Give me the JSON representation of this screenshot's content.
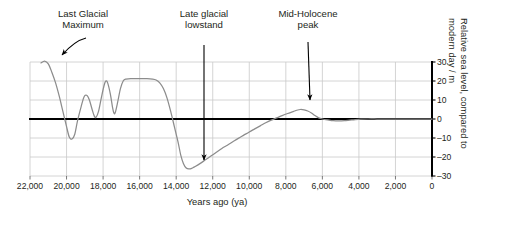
{
  "chart_data": {
    "type": "line",
    "title": "",
    "xlabel": "Years ago (ya)",
    "ylabel": "Relative sea level, compared to modern day / m",
    "xlim": [
      22000,
      0
    ],
    "ylim": [
      -30,
      30
    ],
    "grid": true,
    "legend": "none",
    "x_ticks": [
      "22,000",
      "20,000",
      "18,000",
      "16,000",
      "14,000",
      "12,000",
      "10,000",
      "8,000",
      "6,000",
      "4,000",
      "2,000",
      "0"
    ],
    "x_tick_values": [
      22000,
      20000,
      18000,
      16000,
      14000,
      12000,
      10000,
      8000,
      6000,
      4000,
      2000,
      0
    ],
    "y_ticks": [
      "30",
      "20",
      "10",
      "0",
      "–10",
      "–20",
      "–30"
    ],
    "y_tick_values": [
      30,
      20,
      10,
      0,
      -10,
      -20,
      -30
    ],
    "series": [
      {
        "name": "Relative sea level",
        "color": "#8c8c8c",
        "points": [
          [
            21400,
            29.5
          ],
          [
            21200,
            30.5
          ],
          [
            21000,
            29.0
          ],
          [
            20800,
            24.5
          ],
          [
            20600,
            19.0
          ],
          [
            20400,
            12.0
          ],
          [
            20200,
            4.0
          ],
          [
            20000,
            -4.0
          ],
          [
            19850,
            -9.5
          ],
          [
            19700,
            -10.5
          ],
          [
            19550,
            -8.0
          ],
          [
            19400,
            -1.0
          ],
          [
            19200,
            6.5
          ],
          [
            19050,
            11.5
          ],
          [
            18900,
            12.5
          ],
          [
            18750,
            10.0
          ],
          [
            18600,
            5.0
          ],
          [
            18480,
            1.5
          ],
          [
            18380,
            1.0
          ],
          [
            18250,
            4.0
          ],
          [
            18100,
            11.0
          ],
          [
            17950,
            17.5
          ],
          [
            17850,
            20.0
          ],
          [
            17750,
            19.0
          ],
          [
            17600,
            13.0
          ],
          [
            17480,
            6.0
          ],
          [
            17400,
            3.0
          ],
          [
            17330,
            3.5
          ],
          [
            17200,
            9.0
          ],
          [
            17050,
            16.0
          ],
          [
            16900,
            20.0
          ],
          [
            16750,
            21.0
          ],
          [
            16400,
            21.2
          ],
          [
            16000,
            21.2
          ],
          [
            15600,
            21.2
          ],
          [
            15300,
            21.0
          ],
          [
            15100,
            20.5
          ],
          [
            14900,
            19.0
          ],
          [
            14700,
            16.0
          ],
          [
            14500,
            11.0
          ],
          [
            14300,
            4.0
          ],
          [
            14100,
            -4.0
          ],
          [
            13900,
            -12.0
          ],
          [
            13750,
            -19.0
          ],
          [
            13600,
            -23.5
          ],
          [
            13450,
            -25.8
          ],
          [
            13300,
            -26.3
          ],
          [
            13150,
            -26.0
          ],
          [
            13000,
            -25.2
          ],
          [
            12700,
            -23.5
          ],
          [
            12400,
            -21.5
          ],
          [
            12100,
            -19.5
          ],
          [
            11800,
            -17.5
          ],
          [
            11500,
            -15.5
          ],
          [
            11200,
            -13.8
          ],
          [
            10900,
            -12.0
          ],
          [
            10600,
            -10.2
          ],
          [
            10300,
            -8.5
          ],
          [
            10000,
            -6.8
          ],
          [
            9700,
            -5.2
          ],
          [
            9400,
            -3.6
          ],
          [
            9100,
            -2.0
          ],
          [
            8800,
            -0.6
          ],
          [
            8500,
            0.6
          ],
          [
            8200,
            1.8
          ],
          [
            7900,
            2.9
          ],
          [
            7600,
            3.9
          ],
          [
            7400,
            4.6
          ],
          [
            7200,
            5.0
          ],
          [
            7000,
            4.8
          ],
          [
            6800,
            4.2
          ],
          [
            6600,
            3.2
          ],
          [
            6400,
            1.8
          ],
          [
            6200,
            0.6
          ],
          [
            6000,
            0.0
          ],
          [
            5700,
            -0.5
          ],
          [
            5400,
            -0.9
          ],
          [
            5100,
            -1.0
          ],
          [
            4800,
            -0.9
          ],
          [
            4500,
            -0.6
          ],
          [
            4200,
            -0.3
          ],
          [
            3900,
            -0.1
          ],
          [
            3500,
            0.0
          ],
          [
            3000,
            0.0
          ],
          [
            2500,
            0.0
          ],
          [
            2000,
            0.0
          ],
          [
            1500,
            0.0
          ],
          [
            1000,
            0.0
          ],
          [
            500,
            0.0
          ],
          [
            0,
            0.0
          ]
        ]
      }
    ],
    "annotations": [
      {
        "id": "lgm",
        "text": "Last Glacial\nMaximum",
        "target_x": 20900,
        "target_y": 30,
        "arrow": "curved"
      },
      {
        "id": "lowstand",
        "text": "Late glacial\nlowstand",
        "target_x": 13400,
        "target_y": -25,
        "arrow": "straight"
      },
      {
        "id": "midholocene",
        "text": "Mid-Holocene\npeak",
        "target_x": 7300,
        "target_y": 6,
        "arrow": "straight"
      }
    ],
    "colors": {
      "line": "#8c8c8c",
      "grid": "#c9c9c9",
      "axis": "#000000",
      "text": "#231f20",
      "background": "#ffffff"
    }
  }
}
